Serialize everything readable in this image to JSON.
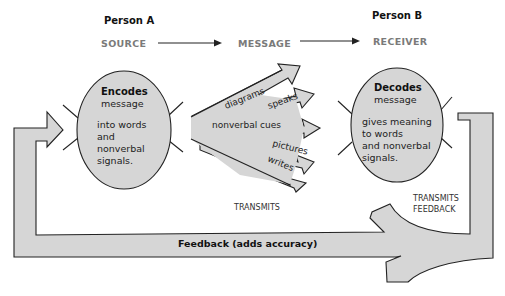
{
  "diagram": {
    "person_a": "Person A",
    "person_b": "Person B",
    "stages": {
      "source": "SOURCE",
      "message": "MESSAGE",
      "receiver": "RECEIVER"
    },
    "encoder": {
      "title": "Encodes",
      "line1": "message",
      "line2": "into words",
      "line3": "and",
      "line4": "nonverbal",
      "line5": "signals."
    },
    "decoder": {
      "title": "Decodes",
      "line1": "message",
      "line2": "gives meaning",
      "line3": "to words",
      "line4": "and nonverbal",
      "line5": "signals."
    },
    "channels": [
      "diagrams",
      "speaks",
      "nonverbal cues",
      "pictures",
      "writes"
    ],
    "transmits": "TRANSMITS",
    "transmits_feedback_1": "TRANSMITS",
    "transmits_feedback_2": "FEEDBACK",
    "feedback": "Feedback (adds accuracy)",
    "colors": {
      "shape_fill": "#d6d6d6",
      "stroke": "#222222",
      "stage_text": "#7a7a7a"
    }
  }
}
